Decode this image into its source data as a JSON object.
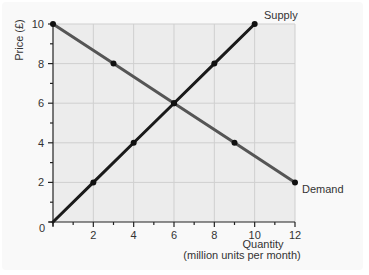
{
  "chart_data": {
    "type": "line",
    "title": "",
    "xlabel": "Quantity",
    "xlabel_sub": "(million units per month)",
    "ylabel": "Price (£)",
    "xlim": [
      0,
      12
    ],
    "ylim": [
      0,
      10
    ],
    "x_ticks": [
      0,
      2,
      4,
      6,
      8,
      10,
      12
    ],
    "y_ticks": [
      0,
      2,
      4,
      6,
      8,
      10
    ],
    "x_minor_ticks": [
      1,
      3,
      5,
      7,
      9,
      11
    ],
    "y_minor_ticks": [
      1,
      3,
      5,
      7,
      9
    ],
    "grid": true,
    "legend_position": "inline labels at line ends",
    "series": [
      {
        "name": "Supply",
        "color": "#1a1a1a",
        "x": [
          0,
          2,
          4,
          6,
          8,
          10
        ],
        "y": [
          0,
          2,
          4,
          6,
          8,
          10
        ],
        "markers": [
          [
            2,
            2
          ],
          [
            4,
            4
          ],
          [
            6,
            6
          ],
          [
            8,
            8
          ],
          [
            10,
            10
          ]
        ]
      },
      {
        "name": "Demand",
        "color": "#555555",
        "x": [
          0,
          3,
          6,
          9,
          12
        ],
        "y": [
          10,
          8,
          6,
          4,
          2
        ],
        "markers": [
          [
            0,
            10
          ],
          [
            3,
            8
          ],
          [
            6,
            6
          ],
          [
            9,
            4
          ],
          [
            12,
            2
          ]
        ]
      }
    ],
    "equilibrium": {
      "x": 6,
      "y": 6
    }
  },
  "labels": {
    "supply": "Supply",
    "demand": "Demand",
    "x_title": "Quantity",
    "x_subtitle": "(million units per month)",
    "y_title": "Price (£)",
    "origin": "0"
  },
  "colors": {
    "plot_bg": "#ececec",
    "grid": "#cfcfcf",
    "axis": "#222222",
    "supply": "#1a1a1a",
    "demand": "#555555"
  }
}
